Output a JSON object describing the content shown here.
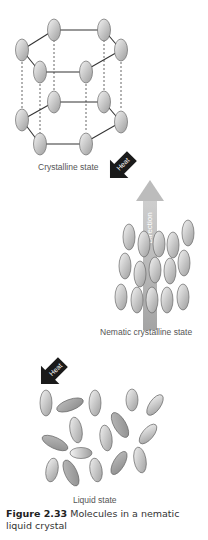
{
  "figure": {
    "title": "Molecules in a nematic liquid crystal",
    "number_label": "Figure 2.33",
    "caption_text": "Molecules in a nematic liquid crystal"
  },
  "states": {
    "crystalline": {
      "label": "Crystalline state"
    },
    "nematic": {
      "label": "Nematic crystalline state"
    },
    "liquid": {
      "label": "Liquid state"
    }
  },
  "arrows": {
    "heat_1": {
      "label": "Heat",
      "color": "#1a1a1a"
    },
    "direction": {
      "label": "Direction",
      "color": "#a9a9a9"
    },
    "heat_2": {
      "label": "Heat",
      "color": "#1a1a1a"
    }
  },
  "colors": {
    "molecule_light": "#f2f2f2",
    "molecule_dark": "#9a9a9a",
    "molecule_stroke": "#666666",
    "bond": "#333333"
  }
}
